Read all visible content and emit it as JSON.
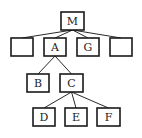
{
  "diagram": {
    "type": "tree",
    "root": "M",
    "nodes": [
      {
        "id": "M",
        "label": "M",
        "x": 61,
        "y": 12,
        "w": 23,
        "h": 18
      },
      {
        "id": "blank1",
        "label": "",
        "x": 11,
        "y": 38,
        "w": 22,
        "h": 18
      },
      {
        "id": "A",
        "label": "A",
        "x": 44,
        "y": 38,
        "w": 22,
        "h": 18
      },
      {
        "id": "G",
        "label": "G",
        "x": 77,
        "y": 38,
        "w": 22,
        "h": 18
      },
      {
        "id": "blank2",
        "label": "",
        "x": 110,
        "y": 38,
        "w": 22,
        "h": 18
      },
      {
        "id": "B",
        "label": "B",
        "x": 27,
        "y": 74,
        "w": 22,
        "h": 18
      },
      {
        "id": "C",
        "label": "C",
        "x": 60,
        "y": 74,
        "w": 23,
        "h": 18
      },
      {
        "id": "D",
        "label": "D",
        "x": 33,
        "y": 108,
        "w": 22,
        "h": 18
      },
      {
        "id": "E",
        "label": "E",
        "x": 65,
        "y": 108,
        "w": 22,
        "h": 18
      },
      {
        "id": "F",
        "label": "F",
        "x": 97,
        "y": 108,
        "w": 23,
        "h": 18
      }
    ],
    "edges": [
      {
        "from": "M",
        "to": "blank1"
      },
      {
        "from": "M",
        "to": "A"
      },
      {
        "from": "M",
        "to": "G"
      },
      {
        "from": "M",
        "to": "blank2"
      },
      {
        "from": "A",
        "to": "B"
      },
      {
        "from": "A",
        "to": "C"
      },
      {
        "from": "C",
        "to": "D"
      },
      {
        "from": "C",
        "to": "E"
      },
      {
        "from": "C",
        "to": "F"
      }
    ]
  }
}
